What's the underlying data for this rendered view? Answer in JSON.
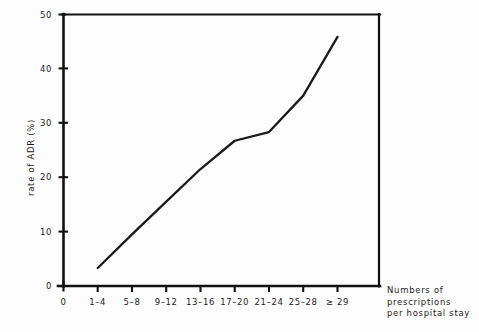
{
  "chart_data": {
    "type": "line",
    "title": "",
    "subtitle": "",
    "xlabel": "Numbers of prescriptions per hospital stay",
    "ylabel": "rate of ADR (%)",
    "categories": [
      "0",
      "1–4",
      "5–8",
      "9–12",
      "13–16",
      "17–20",
      "21–24",
      "25–28",
      "≥ 29"
    ],
    "x": [
      0,
      1,
      2,
      3,
      4,
      5,
      6,
      7,
      8
    ],
    "values": [
      null,
      3.3,
      9.5,
      15.5,
      21.5,
      26.7,
      28.3,
      35.0,
      45.8
    ],
    "series": [
      {
        "name": "rate of ADR (%)",
        "values": [
          null,
          3.3,
          9.5,
          15.5,
          21.5,
          26.7,
          28.3,
          35.0,
          45.8
        ]
      }
    ],
    "xlim": [
      0,
      8
    ],
    "ylim": [
      0,
      50
    ],
    "yticks": [
      0,
      10,
      20,
      30,
      40,
      50
    ],
    "ytick_labels": [
      "0",
      "10",
      "20",
      "30",
      "40",
      "50"
    ],
    "xtick_labels": [
      "0",
      "1–4",
      "5–8",
      "9–12",
      "13–16",
      "17–20",
      "21–24",
      "25–28",
      "≥ 29"
    ],
    "grid": false,
    "legend": false,
    "legend_position": "none",
    "line_color": "#1a1a1a",
    "axis_color": "#111111",
    "background_color": "#fdfdfd",
    "markers": false,
    "annotations": []
  },
  "axis_caption": {
    "line1": "Numbers of",
    "line2": "prescriptions",
    "line3": "per hospital stay"
  }
}
